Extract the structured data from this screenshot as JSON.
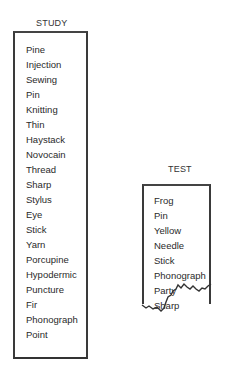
{
  "study": {
    "title": "STUDY",
    "items": [
      "Pine",
      "Injection",
      "Sewing",
      "Pin",
      "Knitting",
      "Thin",
      "Haystack",
      "Novocain",
      "Thread",
      "Sharp",
      "Stylus",
      "Eye",
      "Stick",
      "Yarn",
      "Porcupine",
      "Hypodermic",
      "Puncture",
      "Fir",
      "Phonograph",
      "Point"
    ]
  },
  "test": {
    "title": "TEST",
    "items": [
      "Frog",
      "Pin",
      "Yellow",
      "Needle",
      "Stick",
      "Phonograph",
      "Party",
      "Sharp"
    ],
    "torn_bottom": true
  },
  "colors": {
    "ink": "#2a2a2a",
    "paper": "#ffffff"
  }
}
